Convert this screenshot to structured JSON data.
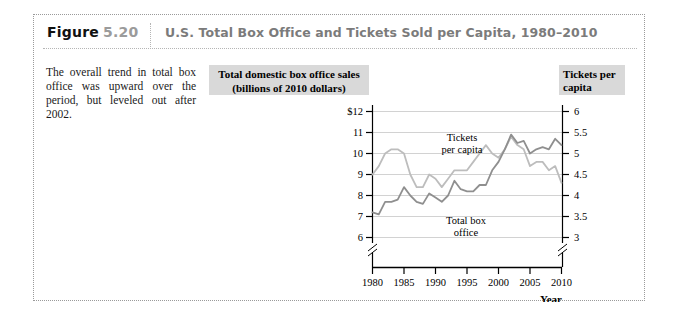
{
  "figure": {
    "label": "Figure",
    "number": "5.20",
    "title": "U.S. Total Box Office and Tickets Sold per Capita, 1980–2010"
  },
  "caption": {
    "text": "The overall trend in total box office was upward over the period, but leveled out after 2002."
  },
  "banners": {
    "left_line1": "Total domestic box office sales",
    "left_line2": "(billions of 2010 dollars)",
    "right_line1": "Tickets per",
    "right_line2": "capita"
  },
  "colors": {
    "tickets_line": "#bdbdbd",
    "box_office_line": "#8f8f8f",
    "gridline": "#d2d2d2",
    "axis": "#000000",
    "banner_bg": "#d9d9d9",
    "figure_number": "#9b9b9b",
    "figure_title": "#7b7b7b"
  },
  "chart_data": {
    "type": "line",
    "title": "U.S. Total Box Office and Tickets Sold per Capita, 1980–2010",
    "xlabel": "Year",
    "ylabel": "Total domestic box office sales (billions of 2010 dollars)",
    "y2label": "Tickets per capita",
    "xlim": [
      1980,
      2010
    ],
    "ylim": [
      6,
      12
    ],
    "y2lim": [
      3,
      6
    ],
    "grid": true,
    "legend": "inline-annotations",
    "axis_break_y": true,
    "xticks": [
      "1980",
      "1985",
      "1990",
      "1995",
      "2000",
      "2005",
      "2010"
    ],
    "yticks": [
      "$12",
      "11",
      "10",
      "9",
      "8",
      "7",
      "6"
    ],
    "y2ticks": [
      "6",
      "5.5",
      "5",
      "4.5",
      "4",
      "3.5",
      "3"
    ],
    "x": [
      1980,
      1981,
      1982,
      1983,
      1984,
      1985,
      1986,
      1987,
      1988,
      1989,
      1990,
      1991,
      1992,
      1993,
      1994,
      1995,
      1996,
      1997,
      1998,
      1999,
      2000,
      2001,
      2002,
      2003,
      2004,
      2005,
      2006,
      2007,
      2008,
      2009,
      2010
    ],
    "series": [
      {
        "name": "Total box office",
        "axis": "left",
        "color": "#8f8f8f",
        "label_x": 1990,
        "label_y": 7.4,
        "values": [
          7.2,
          7.1,
          7.7,
          7.7,
          7.8,
          8.4,
          8.0,
          7.7,
          7.6,
          8.1,
          7.9,
          7.7,
          8.0,
          8.7,
          8.3,
          8.2,
          8.2,
          8.5,
          8.5,
          9.2,
          9.6,
          10.2,
          10.9,
          10.5,
          10.6,
          10.0,
          10.2,
          10.3,
          10.2,
          10.7,
          10.4
        ]
      },
      {
        "name": "Tickets per capita",
        "axis": "right",
        "color": "#bdbdbd",
        "label_x": 1990,
        "label_y": 5.45,
        "values": [
          4.5,
          4.7,
          5.0,
          5.1,
          5.1,
          5.0,
          4.5,
          4.2,
          4.2,
          4.5,
          4.4,
          4.2,
          4.4,
          4.6,
          4.6,
          4.6,
          4.8,
          5.0,
          5.2,
          5.0,
          4.9,
          5.1,
          5.4,
          5.2,
          5.1,
          4.7,
          4.8,
          4.8,
          4.6,
          4.7,
          4.3
        ]
      }
    ],
    "annotations": [
      {
        "text": "Tickets",
        "x": 1990,
        "y": 5.6
      },
      {
        "text": "per capita",
        "x": 1990,
        "y": 5.45
      },
      {
        "text": "Total box",
        "x": 1991,
        "y": 7.5
      },
      {
        "text": "office",
        "x": 1991,
        "y": 7.2
      }
    ]
  }
}
